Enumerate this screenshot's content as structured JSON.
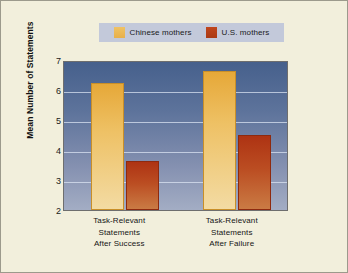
{
  "figure": {
    "background_color": "#f2efdc",
    "border_color": "#9c9a8c"
  },
  "legend": {
    "position": "top-center",
    "background_color": "#c3c9da",
    "entries": [
      {
        "label": "Chinese mothers",
        "color": "#e8b04a",
        "swatch_name": "chinese-mothers-swatch"
      },
      {
        "label": "U.S. mothers",
        "color": "#b03a18",
        "swatch_name": "us-mothers-swatch"
      }
    ]
  },
  "axes": {
    "ylabel": "Mean Number of Statements",
    "yticks": [
      "7",
      "6",
      "5",
      "4",
      "3",
      "2"
    ],
    "ymin": 2,
    "ymax": 7,
    "grid": true,
    "plot_background_top": "#46608c",
    "plot_background_bottom": "#a3adc4"
  },
  "categories": [
    {
      "lines": [
        "Task-Relevant",
        "Statements",
        "After Success"
      ]
    },
    {
      "lines": [
        "Task-Relevant",
        "Statements",
        "After Failure"
      ]
    }
  ],
  "chart_data": {
    "type": "bar",
    "title": "",
    "xlabel": "",
    "ylabel": "Mean Number of Statements",
    "ylim": [
      2,
      7
    ],
    "yticks": [
      2,
      3,
      4,
      5,
      6,
      7
    ],
    "grid": true,
    "legend_position": "top-center",
    "categories": [
      "Task-Relevant Statements After Success",
      "Task-Relevant Statements After Failure"
    ],
    "series": [
      {
        "name": "Chinese mothers",
        "color": "#e8b04a",
        "values": [
          6.3,
          6.7
        ]
      },
      {
        "name": "U.S. mothers",
        "color": "#b03a18",
        "values": [
          3.65,
          4.55
        ]
      }
    ]
  }
}
